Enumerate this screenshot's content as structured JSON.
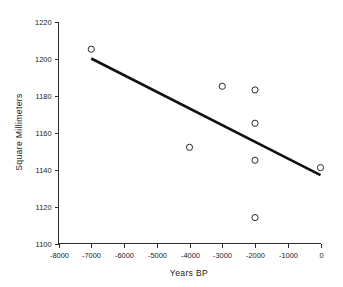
{
  "chart_data": {
    "type": "scatter",
    "title": "",
    "subtitle": "",
    "xlabel": "Years BP",
    "ylabel": "Square Millimeters",
    "xlim": [
      -8000,
      0
    ],
    "ylim": [
      1100,
      1220
    ],
    "grid": false,
    "legend": null,
    "xticks": [
      -8000,
      -7000,
      -6000,
      -5000,
      -4000,
      -3000,
      -2000,
      -1000,
      0
    ],
    "xtick_labels": [
      "-8000",
      "-7000",
      "-6000",
      "-5000",
      "-4000",
      "-3000",
      "-2000",
      "-1000",
      "0"
    ],
    "yticks": [
      1100,
      1120,
      1140,
      1160,
      1180,
      1200,
      1220
    ],
    "ytick_labels": [
      "1100",
      "1120",
      "1140",
      "1160",
      "1180",
      "1200",
      "1220"
    ],
    "marker": "open-circle",
    "marker_color": "#2b2b2b",
    "points": [
      {
        "x": -7000,
        "y": 1205
      },
      {
        "x": -4000,
        "y": 1152
      },
      {
        "x": -3000,
        "y": 1185
      },
      {
        "x": -2000,
        "y": 1183
      },
      {
        "x": -2000,
        "y": 1165
      },
      {
        "x": -2000,
        "y": 1145
      },
      {
        "x": -2000,
        "y": 1114
      },
      {
        "x": 0,
        "y": 1141
      }
    ],
    "series": [
      {
        "name": "observations",
        "x": [
          -7000,
          -4000,
          -3000,
          -2000,
          -2000,
          -2000,
          -2000,
          0
        ],
        "values": [
          1205,
          1152,
          1185,
          1183,
          1165,
          1145,
          1114,
          1141
        ]
      }
    ],
    "trend_line": {
      "name": "regression",
      "color": "#111111",
      "x_start": -7000,
      "y_start": 1200,
      "x_end": 0,
      "y_end": 1137
    }
  },
  "axes": {
    "x_title": "Years BP",
    "y_title": "Square Millimeters"
  }
}
